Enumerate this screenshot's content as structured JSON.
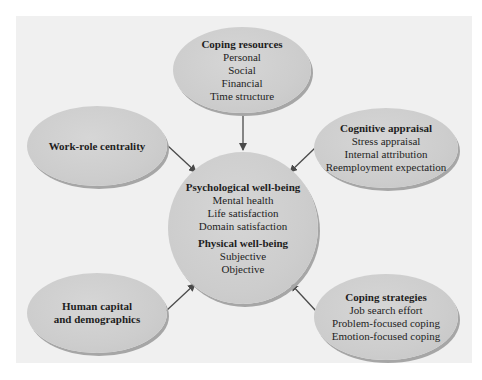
{
  "diagram": {
    "colors": {
      "panel_background": "#f0f0f0",
      "node_fill": "#cdcdcd",
      "node_shadow": "#a6a6a6",
      "arrow": "#4a4a4a",
      "text": "#1e1e1e"
    },
    "nodes": {
      "coping_resources": {
        "title": "Coping resources",
        "items": [
          "Personal",
          "Social",
          "Financial",
          "Time structure"
        ]
      },
      "work_role_centrality": {
        "title": "Work-role centrality"
      },
      "cognitive_appraisal": {
        "title": "Cognitive appraisal",
        "items": [
          "Stress appraisal",
          "Internal attribution",
          "Reemployment expectation"
        ]
      },
      "well_being": {
        "psychological_title": "Psychological well-being",
        "psychological_items": [
          "Mental health",
          "Life satisfaction",
          "Domain satisfaction"
        ],
        "physical_title": "Physical well-being",
        "physical_items": [
          "Subjective",
          "Objective"
        ]
      },
      "human_capital": {
        "title_line1": "Human capital",
        "title_line2": "and demographics"
      },
      "coping_strategies": {
        "title": "Coping strategies",
        "items": [
          "Job search effort",
          "Problem-focused coping",
          "Emotion-focused coping"
        ]
      }
    },
    "edges": [
      {
        "from": "Coping resources",
        "to": "Psychological/Physical well-being"
      },
      {
        "from": "Work-role centrality",
        "to": "Psychological/Physical well-being"
      },
      {
        "from": "Cognitive appraisal",
        "to": "Psychological/Physical well-being"
      },
      {
        "from": "Human capital and demographics",
        "to": "Psychological/Physical well-being"
      },
      {
        "from": "Coping strategies",
        "to": "Psychological/Physical well-being"
      }
    ]
  }
}
